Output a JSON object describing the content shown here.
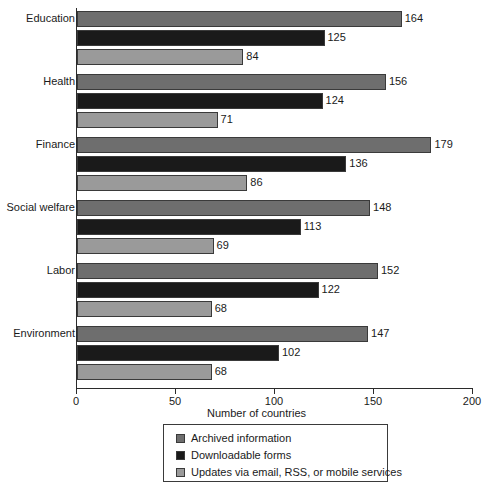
{
  "chart_data": {
    "type": "bar",
    "orientation": "horizontal",
    "title": "",
    "xlabel": "Number of countries",
    "ylabel": "",
    "xlim": [
      0,
      200
    ],
    "xticks": [
      0,
      50,
      100,
      150,
      200
    ],
    "xtick_labels": [
      "0",
      "50",
      "100",
      "150",
      "200"
    ],
    "grid": false,
    "legend_position": "bottom-center",
    "categories": [
      "Education",
      "Health",
      "Finance",
      "Social welfare",
      "Labor",
      "Environment"
    ],
    "series": [
      {
        "name": "Archived information",
        "color": "#6e6e6e",
        "values": [
          164,
          156,
          179,
          148,
          152,
          147
        ]
      },
      {
        "name": "Downloadable forms",
        "color": "#1a1a1a",
        "values": [
          125,
          124,
          136,
          113,
          122,
          102
        ]
      },
      {
        "name": "Updates via email, RSS, or mobile services",
        "color": "#9a9a9a",
        "values": [
          84,
          71,
          86,
          69,
          68,
          68
        ]
      }
    ]
  },
  "axis": {
    "x_title": "Number of countries"
  },
  "legend": {
    "entries": [
      "Archived information",
      "Downloadable forms",
      "Updates via email, RSS, or mobile services"
    ]
  },
  "colors": {
    "series1": "#6e6e6e",
    "series2": "#1a1a1a",
    "series3": "#9a9a9a",
    "axis": "#2b2b2b",
    "text": "#1a1a1a",
    "background": "#ffffff"
  }
}
